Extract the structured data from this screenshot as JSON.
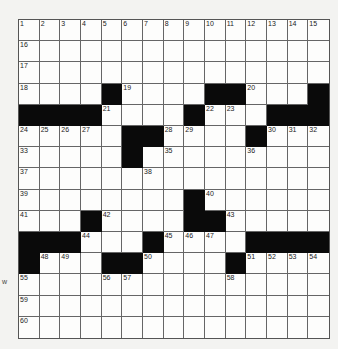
{
  "puzzle": {
    "rows": 15,
    "cols": 15,
    "layout": [
      "...............",
      "...............",
      "...............",
      "....#....##...#",
      "####....#...###",
      ".....##....#...",
      ".....#.........",
      "...............",
      "........#......",
      "...#....##.....",
      "###...#....####",
      "#...##....#....",
      "...............",
      "...............",
      "..............."
    ],
    "numbers": [
      {
        "r": 0,
        "c": 0,
        "n": "1"
      },
      {
        "r": 0,
        "c": 1,
        "n": "2"
      },
      {
        "r": 0,
        "c": 2,
        "n": "3"
      },
      {
        "r": 0,
        "c": 3,
        "n": "4"
      },
      {
        "r": 0,
        "c": 4,
        "n": "5"
      },
      {
        "r": 0,
        "c": 5,
        "n": "6"
      },
      {
        "r": 0,
        "c": 6,
        "n": "7"
      },
      {
        "r": 0,
        "c": 7,
        "n": "8"
      },
      {
        "r": 0,
        "c": 8,
        "n": "9"
      },
      {
        "r": 0,
        "c": 9,
        "n": "10"
      },
      {
        "r": 0,
        "c": 10,
        "n": "11"
      },
      {
        "r": 0,
        "c": 11,
        "n": "12"
      },
      {
        "r": 0,
        "c": 12,
        "n": "13"
      },
      {
        "r": 0,
        "c": 13,
        "n": "14"
      },
      {
        "r": 0,
        "c": 14,
        "n": "15"
      },
      {
        "r": 1,
        "c": 0,
        "n": "16"
      },
      {
        "r": 2,
        "c": 0,
        "n": "17"
      },
      {
        "r": 3,
        "c": 0,
        "n": "18"
      },
      {
        "r": 3,
        "c": 5,
        "n": "19"
      },
      {
        "r": 3,
        "c": 11,
        "n": "20"
      },
      {
        "r": 4,
        "c": 4,
        "n": "21"
      },
      {
        "r": 4,
        "c": 9,
        "n": "22"
      },
      {
        "r": 4,
        "c": 10,
        "n": "23"
      },
      {
        "r": 5,
        "c": 0,
        "n": "24"
      },
      {
        "r": 5,
        "c": 1,
        "n": "25"
      },
      {
        "r": 5,
        "c": 2,
        "n": "26"
      },
      {
        "r": 5,
        "c": 3,
        "n": "27"
      },
      {
        "r": 5,
        "c": 7,
        "n": "28"
      },
      {
        "r": 5,
        "c": 8,
        "n": "29"
      },
      {
        "r": 5,
        "c": 12,
        "n": "30"
      },
      {
        "r": 5,
        "c": 13,
        "n": "31"
      },
      {
        "r": 5,
        "c": 14,
        "n": "32"
      },
      {
        "r": 6,
        "c": 0,
        "n": "33"
      },
      {
        "r": 6,
        "c": 5,
        "n": "34"
      },
      {
        "r": 6,
        "c": 7,
        "n": "35"
      },
      {
        "r": 6,
        "c": 11,
        "n": "36"
      },
      {
        "r": 7,
        "c": 0,
        "n": "37"
      },
      {
        "r": 7,
        "c": 6,
        "n": "38"
      },
      {
        "r": 8,
        "c": 0,
        "n": "39"
      },
      {
        "r": 8,
        "c": 9,
        "n": "40"
      },
      {
        "r": 9,
        "c": 0,
        "n": "41"
      },
      {
        "r": 9,
        "c": 4,
        "n": "42"
      },
      {
        "r": 9,
        "c": 10,
        "n": "43"
      },
      {
        "r": 10,
        "c": 3,
        "n": "44"
      },
      {
        "r": 10,
        "c": 7,
        "n": "45"
      },
      {
        "r": 10,
        "c": 8,
        "n": "46"
      },
      {
        "r": 10,
        "c": 9,
        "n": "47"
      },
      {
        "r": 11,
        "c": 1,
        "n": "48"
      },
      {
        "r": 11,
        "c": 2,
        "n": "49"
      },
      {
        "r": 11,
        "c": 6,
        "n": "50"
      },
      {
        "r": 11,
        "c": 11,
        "n": "51"
      },
      {
        "r": 11,
        "c": 12,
        "n": "52"
      },
      {
        "r": 11,
        "c": 13,
        "n": "53"
      },
      {
        "r": 11,
        "c": 14,
        "n": "54"
      },
      {
        "r": 12,
        "c": 0,
        "n": "55"
      },
      {
        "r": 12,
        "c": 4,
        "n": "56"
      },
      {
        "r": 12,
        "c": 5,
        "n": "57"
      },
      {
        "r": 12,
        "c": 10,
        "n": "58"
      },
      {
        "r": 13,
        "c": 0,
        "n": "59"
      },
      {
        "r": 14,
        "c": 0,
        "n": "60"
      }
    ]
  },
  "stray_text": "w"
}
